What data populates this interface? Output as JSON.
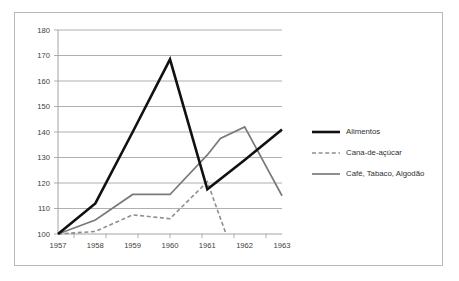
{
  "chart_data": {
    "type": "line",
    "title": "",
    "subtitle": "",
    "xlabel": "",
    "ylabel": "",
    "x": [
      1957,
      1958,
      1959,
      1960,
      1961,
      1962,
      1963
    ],
    "xtick_labels": [
      "1957",
      "1958",
      "1959",
      "1960",
      "1961",
      "1962",
      "1963"
    ],
    "ytick_labels": [
      "100",
      "110",
      "120",
      "130",
      "140",
      "150",
      "160",
      "170",
      "180"
    ],
    "ytick_values": [
      100,
      110,
      120,
      130,
      140,
      150,
      160,
      170,
      180
    ],
    "xlim": [
      1957,
      1963
    ],
    "ylim": [
      100,
      180
    ],
    "grid": "horizontal",
    "legend_position": "right",
    "series": [
      {
        "name": "Alimentos",
        "color": "#111111",
        "style": "solid",
        "width": 2.6,
        "values": [
          100,
          112,
          140,
          168.5,
          117.5,
          129,
          141
        ]
      },
      {
        "name": "Cana-de-açúcar",
        "color": "#8e8e8e",
        "style": "dashed",
        "width": 1.6,
        "values": [
          100,
          101,
          107.5,
          106,
          120.5,
          100,
          null
        ],
        "note": "series ends mid-1961 to 1962 falling back to 100"
      },
      {
        "name": "Café, Tabaco, Algodão",
        "color": "#7a7a7a",
        "style": "solid",
        "width": 1.7,
        "values": [
          100,
          105.5,
          115.5,
          115.5,
          131,
          142,
          115
        ]
      }
    ],
    "legend": [
      {
        "label": "Alimentos",
        "color": "#111111",
        "style": "solid"
      },
      {
        "label": "Cana-de-açúcar",
        "color": "#8e8e8e",
        "style": "dashed"
      },
      {
        "label": "Café, Tabaco, Algodão",
        "color": "#7a7a7a",
        "style": "solid"
      }
    ]
  }
}
